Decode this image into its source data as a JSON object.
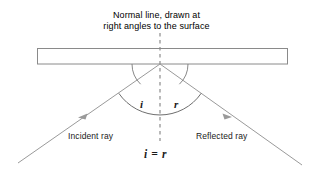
{
  "diagram": {
    "title_line_1": "Normal line, drawn at",
    "title_line_2": "right angles to the surface",
    "incident_ray_label": "Incident ray",
    "reflected_ray_label": "Reflected ray",
    "angle_incidence_label": "i",
    "angle_reflection_label": "r",
    "equality_label": "i = r",
    "colors": {
      "line": "#8c8c8c",
      "surface_outline": "#8a8a8a",
      "arc": "#6e6e6e",
      "text": "#1a1a1a",
      "background": "#ffffff"
    },
    "geometry": {
      "vertex_x": 160,
      "vertex_y": 64,
      "normal_top_y": 33,
      "normal_bottom_y": 141,
      "surface_left_x": 37,
      "surface_right_x": 288,
      "surface_top_y": 48,
      "surface_bottom_y": 64,
      "incident_start_x": 18,
      "incident_start_y": 163,
      "reflected_end_x": 302,
      "reflected_end_y": 165
    }
  }
}
